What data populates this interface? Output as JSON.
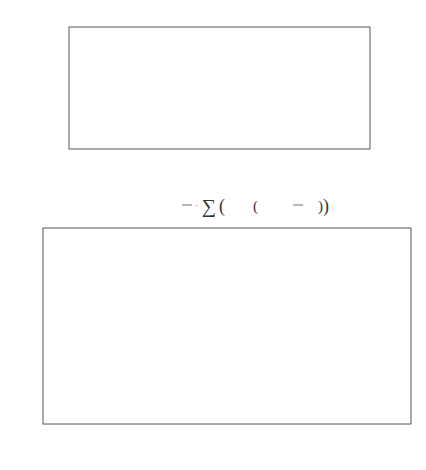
{
  "chart_data": [
    {
      "type": "bar",
      "subtype": "stem",
      "title": "Rectangular",
      "definition": "x1(n) := 1",
      "xlabel": "n",
      "ylabel": "",
      "xlim": [
        -0.7,
        63
      ],
      "ylim": [
        0,
        2
      ],
      "xticks": [
        0,
        20,
        40,
        60
      ],
      "yticks": [
        0,
        1,
        2
      ],
      "n_points": 64,
      "x_start": 0,
      "value": 1
    },
    {
      "type": "line",
      "formula": {
        "lhs": "X1(k) :=",
        "frac_num": "1",
        "frac_den": "N",
        "sum_upper": "N−1",
        "sum_lower": "n = 0",
        "body_pre": "1·exp",
        "body_inner": "−j·2·π·",
        "inner_num": "n",
        "inner_den": "N",
        "body_post": "·k"
      },
      "xlabel": "k",
      "ylabel": "dB",
      "xlim": [
        0,
        31.5
      ],
      "ylim": [
        -100,
        0
      ],
      "xticks": [
        0,
        5,
        10,
        15,
        20,
        25,
        30
      ],
      "yticks": [
        0,
        -50,
        -100
      ],
      "reference_line": -50,
      "N": 64,
      "description": "Dirichlet kernel magnitude in dB, nulls at integer k clipped to -100",
      "sidelobe_peaks_db": [
        {
          "k": 1.43,
          "db": -13.3
        },
        {
          "k": 2.46,
          "db": -17.8
        },
        {
          "k": 3.47,
          "db": -20.8
        },
        {
          "k": 4.48,
          "db": -23.0
        },
        {
          "k": 5.48,
          "db": -24.8
        },
        {
          "k": 10.5,
          "db": -30.2
        },
        {
          "k": 15.5,
          "db": -33.1
        },
        {
          "k": 20.5,
          "db": -35.0
        },
        {
          "k": 25.5,
          "db": -36.3
        },
        {
          "k": 30.5,
          "db": -37.0
        }
      ]
    }
  ],
  "caption": "(a)"
}
